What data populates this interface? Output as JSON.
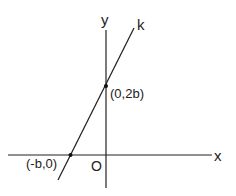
{
  "diagram": {
    "type": "coordinate-plane",
    "axes": {
      "x_label": "x",
      "y_label": "y",
      "origin_label": "O"
    },
    "line": {
      "name": "k",
      "description": "straight line through (-b,0) and (0,2b)"
    },
    "points": [
      {
        "label": "(0,2b)",
        "x": "0",
        "y": "2b"
      },
      {
        "label": "(-b,0)",
        "x": "-b",
        "y": "0"
      }
    ],
    "colors": {
      "stroke": "#222222",
      "background": "#ffffff"
    }
  }
}
